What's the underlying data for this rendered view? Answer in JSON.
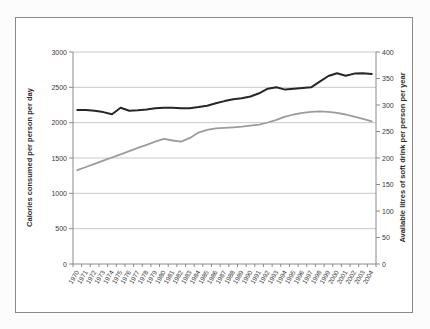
{
  "chart_data": {
    "type": "line",
    "title": "",
    "legend": "none",
    "grid": "horizontal major gridlines from left axis",
    "x": [
      "1970",
      "1971",
      "1972",
      "1973",
      "1974",
      "1975",
      "1976",
      "1977",
      "1978",
      "1979",
      "1980",
      "1981",
      "1982",
      "1983",
      "1984",
      "1985",
      "1986",
      "1987",
      "1988",
      "1989",
      "1990",
      "1991",
      "1992",
      "1993",
      "1994",
      "1995",
      "1996",
      "1997",
      "1998",
      "1999",
      "2000",
      "2001",
      "2002",
      "2003",
      "2004"
    ],
    "left_axis": {
      "title": "Calories consumed per person per day",
      "range": [
        0,
        3000
      ],
      "ticks": [
        0,
        500,
        1000,
        1500,
        2000,
        2500,
        3000
      ]
    },
    "right_axis": {
      "title": "Available litres of soft drink per person per year",
      "range": [
        0,
        400
      ],
      "ticks": [
        0,
        50,
        100,
        150,
        200,
        250,
        300,
        350,
        400
      ]
    },
    "series": [
      {
        "name": "Calories consumed per person per day",
        "axis": "left",
        "color": "#262626",
        "width": 2,
        "values": [
          2180,
          2180,
          2170,
          2150,
          2120,
          2210,
          2170,
          2175,
          2185,
          2205,
          2210,
          2210,
          2205,
          2205,
          2220,
          2240,
          2275,
          2305,
          2330,
          2345,
          2370,
          2415,
          2480,
          2500,
          2468,
          2480,
          2490,
          2500,
          2580,
          2660,
          2700,
          2665,
          2695,
          2700,
          2690
        ]
      },
      {
        "name": "Available litres of soft drink per person per year",
        "axis": "right",
        "color": "#9c9c9c",
        "width": 1.8,
        "values": [
          177,
          183,
          189,
          195,
          201,
          207,
          213,
          219,
          225,
          231,
          236,
          233,
          231,
          238,
          248,
          253,
          256,
          257,
          258,
          259,
          261,
          263,
          267,
          272,
          278,
          282,
          285,
          287,
          288,
          287,
          285,
          282,
          278,
          274,
          269
        ]
      }
    ]
  },
  "colors": {
    "background": "#ffffff",
    "chart_border": "#8a8a8a",
    "axis_line": "#8a8a8a",
    "gridline": "#c9c9c9",
    "tick_text": "#3a3a3a",
    "calories_line": "#262626",
    "soft_drink_line": "#9c9c9c"
  }
}
